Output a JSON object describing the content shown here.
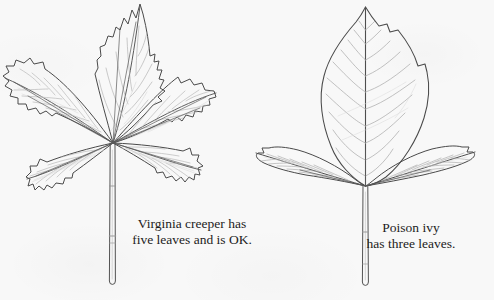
{
  "figure": {
    "kind": "botanical-comparison-illustration",
    "background_color": "#f8f8f8",
    "ink_color": "#3a3a3a",
    "vein_color": "#a8a8a8",
    "width": 494,
    "height": 300
  },
  "plants": [
    {
      "id": "virginia-creeper",
      "common_name": "Virginia creeper",
      "leaflet_count": 5,
      "leaf_arrangement": "palmate",
      "margin": "coarsely toothed",
      "position": "left"
    },
    {
      "id": "poison-ivy",
      "common_name": "Poison ivy",
      "leaflet_count": 3,
      "leaf_arrangement": "trifoliate",
      "margin": "smooth to slightly notched",
      "position": "right"
    }
  ],
  "captions": {
    "creeper": {
      "line1": "Virginia creeper has",
      "line2": "five leaves and is OK."
    },
    "ivy": {
      "line1": "Poison ivy",
      "line2": "has three leaves."
    }
  }
}
